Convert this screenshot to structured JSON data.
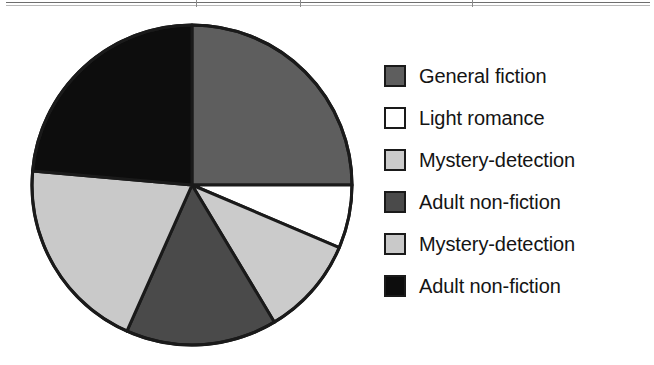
{
  "figure": {
    "background": "#ffffff",
    "rule_color": "#6e6e6e"
  },
  "chart_data": {
    "type": "pie",
    "title": "",
    "subtitle": "",
    "xlabel": "",
    "ylabel": "",
    "grid": false,
    "legend_position": "right",
    "start_angle_deg": 0,
    "direction": "clockwise",
    "units": "percent",
    "center": {
      "cx": 166,
      "cy": 166,
      "r": 160
    },
    "categories": [
      "General fiction",
      "Light romance",
      "Mystery-detection",
      "Adult non-fiction",
      "Mystery-detection",
      "Adult non-fiction"
    ],
    "values": [
      25,
      6.4,
      10,
      15.3,
      19.7,
      23.6
    ],
    "angles_deg": [
      90,
      23,
      36,
      55,
      71,
      85
    ],
    "colors": [
      "#5e5e5e",
      "#ffffff",
      "#cbcbcb",
      "#4a4a4a",
      "#c9c9c9",
      "#0d0d0d"
    ],
    "slices": [
      {
        "label": "General fiction",
        "value": 25.0,
        "angle_deg": 90,
        "color": "#5e5e5e"
      },
      {
        "label": "Light romance",
        "value": 6.4,
        "angle_deg": 23,
        "color": "#ffffff"
      },
      {
        "label": "Mystery-detection",
        "value": 10.0,
        "angle_deg": 36,
        "color": "#cbcbcb"
      },
      {
        "label": "Adult non-fiction",
        "value": 15.3,
        "angle_deg": 55,
        "color": "#4a4a4a"
      },
      {
        "label": "Mystery-detection",
        "value": 19.7,
        "angle_deg": 71,
        "color": "#c9c9c9"
      },
      {
        "label": "Adult non-fiction",
        "value": 23.6,
        "angle_deg": 85,
        "color": "#0d0d0d"
      }
    ],
    "stroke": {
      "color": "#1a1a1a",
      "width": 3
    }
  },
  "legend": {
    "items": [
      {
        "label": "General fiction",
        "color": "#5e5e5e"
      },
      {
        "label": "Light romance",
        "color": "#ffffff"
      },
      {
        "label": "Mystery-detection",
        "color": "#cbcbcb"
      },
      {
        "label": "Adult non-fiction",
        "color": "#4a4a4a"
      },
      {
        "label": "Mystery-detection",
        "color": "#c9c9c9"
      },
      {
        "label": "Adult non-fiction",
        "color": "#0d0d0d"
      }
    ]
  }
}
